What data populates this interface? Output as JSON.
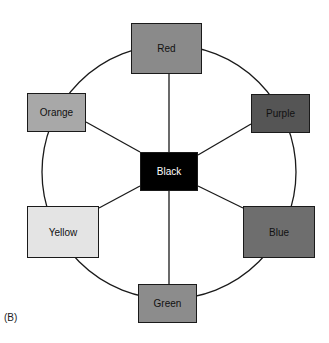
{
  "figure_label": "(B)",
  "center": {
    "label": "Black",
    "fill": "#000000",
    "text_color": "#ffffff"
  },
  "nodes": [
    {
      "id": "red",
      "label": "Red",
      "fill": "#8a8a8a"
    },
    {
      "id": "purple",
      "label": "Purple",
      "fill": "#555555"
    },
    {
      "id": "blue",
      "label": "Blue",
      "fill": "#6e6e6e"
    },
    {
      "id": "green",
      "label": "Green",
      "fill": "#8c8c8c"
    },
    {
      "id": "yellow",
      "label": "Yellow",
      "fill": "#e4e4e4"
    },
    {
      "id": "orange",
      "label": "Orange",
      "fill": "#a8a8a8"
    }
  ]
}
